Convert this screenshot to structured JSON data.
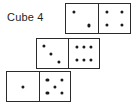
{
  "figure": {
    "caption": "Cube 4",
    "ink_color": "#2b2b2b",
    "pip_color": "#1b1b1b",
    "background_color": "#ffffff"
  },
  "dominoes": [
    {
      "id": "domino-top",
      "position": "top",
      "left_face": {
        "value": "2",
        "pip_positions": [
          "p-x1",
          "p-x2"
        ]
      },
      "right_face": {
        "value": "4",
        "pip_positions": [
          "p-tl",
          "p-tr",
          "p-bl",
          "p-br"
        ]
      },
      "total": "6"
    },
    {
      "id": "domino-middle",
      "position": "middle",
      "left_face": {
        "value": "3",
        "pip_positions": [
          "p-d1",
          "p-d2",
          "p-d3"
        ]
      },
      "right_face": {
        "value": "6",
        "pip_positions": [
          "p-tl",
          "p-tc",
          "p-tr",
          "p-bl",
          "p-bc",
          "p-br"
        ]
      },
      "total": "9"
    },
    {
      "id": "domino-bottom",
      "position": "bottom",
      "left_face": {
        "value": "1",
        "pip_positions": [
          "p-mc"
        ]
      },
      "right_face": {
        "value": "5",
        "pip_positions": [
          "p-tl",
          "p-tr",
          "p-mc",
          "p-bl",
          "p-br"
        ]
      },
      "total": "6"
    }
  ]
}
